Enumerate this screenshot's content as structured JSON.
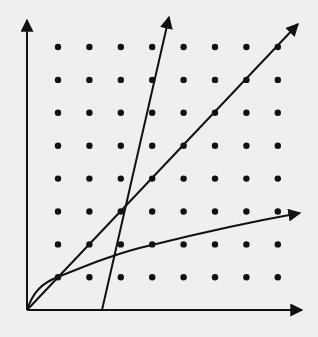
{
  "diagram": {
    "type": "growth-comparison-plot",
    "background": "#efefef",
    "ink_color": "#111111",
    "axes": {
      "origin": [
        27,
        310
      ],
      "y_axis_tip": [
        27,
        20
      ],
      "x_axis_tip": [
        302,
        310
      ]
    },
    "dot_grid": {
      "columns": 8,
      "rows": 8,
      "x_start": 58,
      "y_start": 47,
      "x_step": 31.4,
      "y_step": 32.9,
      "dot_radius": 3.2
    },
    "curves": [
      {
        "name": "linear-diagonal",
        "kind": "line",
        "points": [
          [
            27,
            310
          ],
          [
            298,
            24
          ]
        ]
      },
      {
        "name": "steep-line",
        "kind": "line",
        "points": [
          [
            102,
            310
          ],
          [
            169,
            17
          ]
        ]
      },
      {
        "name": "logarithmic-curve",
        "kind": "curve",
        "path": "M27,310 C33,292 42,283 58,277 C90,264 120,252 152,245 C200,233 250,222 300,213"
      }
    ]
  }
}
